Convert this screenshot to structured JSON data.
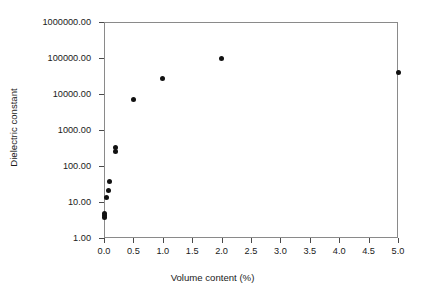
{
  "chart_data": {
    "type": "scatter",
    "title": "",
    "xlabel": "Volume content  (%)",
    "ylabel": "Dielectric constant",
    "xlim": [
      0.0,
      5.0
    ],
    "ylim": [
      1.0,
      1000000.0
    ],
    "yscale": "log",
    "xscale": "linear",
    "grid": false,
    "legend": null,
    "xticks": [
      "0.0",
      "0.5",
      "1.0",
      "1.5",
      "2.0",
      "2.5",
      "3.0",
      "3.5",
      "4.0",
      "4.5",
      "5.0"
    ],
    "xtick_values": [
      0.0,
      0.5,
      1.0,
      1.5,
      2.0,
      2.5,
      3.0,
      3.5,
      4.0,
      4.5,
      5.0
    ],
    "yticks": [
      "1.00",
      "10.00",
      "100.00",
      "1000.00",
      "10000.00",
      "100000.00",
      "1000000.00"
    ],
    "ytick_values": [
      1,
      10,
      100,
      1000,
      10000,
      100000,
      1000000
    ],
    "marker": "filled-circle",
    "marker_color": "#111111",
    "points": [
      {
        "x": 0.0,
        "y": 3.6
      },
      {
        "x": 0.0,
        "y": 4.2
      },
      {
        "x": 0.0,
        "y": 4.9
      },
      {
        "x": 0.04,
        "y": 13.0
      },
      {
        "x": 0.07,
        "y": 21.0
      },
      {
        "x": 0.1,
        "y": 37.0
      },
      {
        "x": 0.2,
        "y": 250.0
      },
      {
        "x": 0.2,
        "y": 330.0
      },
      {
        "x": 0.5,
        "y": 7000.0
      },
      {
        "x": 1.0,
        "y": 27000.0
      },
      {
        "x": 2.0,
        "y": 100000.0
      },
      {
        "x": 5.0,
        "y": 40000.0
      }
    ]
  },
  "axes": {
    "x_title": "Volume content  (%)",
    "y_title": "Dielectric constant"
  }
}
